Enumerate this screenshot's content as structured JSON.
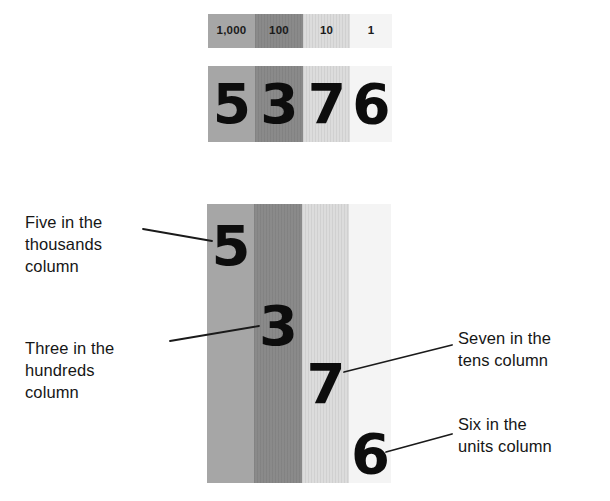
{
  "place_value_key": {
    "columns": [
      {
        "label": "1,000",
        "name": "thousands",
        "shade": "#a6a6a6",
        "striped": false
      },
      {
        "label": "100",
        "name": "hundreds",
        "shade": "#8a8a8a",
        "striped": true
      },
      {
        "label": "10",
        "name": "tens",
        "shade": "#dcdcdc",
        "striped": true
      },
      {
        "label": "1",
        "name": "units",
        "shade": "#f4f4f4",
        "striped": false
      }
    ]
  },
  "compact_number": {
    "digits": [
      "5",
      "3",
      "7",
      "6"
    ]
  },
  "expanded_number": {
    "digits": [
      "5",
      "3",
      "7",
      "6"
    ]
  },
  "annotations": [
    {
      "id": "thousands",
      "text": "Five in the\nthousands\ncolumn"
    },
    {
      "id": "hundreds",
      "text": "Three in the\nhundreds\ncolumn"
    },
    {
      "id": "tens",
      "text": "Seven in the\ntens column"
    },
    {
      "id": "units",
      "text": "Six in the\nunits column"
    }
  ],
  "leader_lines": [
    {
      "id": "thousands-leader",
      "x1": 143,
      "y1": 229,
      "x2": 212,
      "y2": 241
    },
    {
      "id": "hundreds-leader",
      "x1": 170,
      "y1": 341,
      "x2": 259,
      "y2": 326
    },
    {
      "id": "tens-leader",
      "x1": 344,
      "y1": 372,
      "x2": 452,
      "y2": 345
    },
    {
      "id": "units-leader",
      "x1": 386,
      "y1": 452,
      "x2": 452,
      "y2": 434
    }
  ],
  "colors": {
    "ink": "#0d0d0d",
    "leader": "#1a1a1a",
    "page": "#ffffff"
  }
}
